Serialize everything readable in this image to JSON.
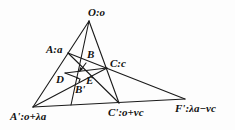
{
  "diagram": {
    "type": "geometric-construction",
    "points": {
      "O": {
        "label": "O:o",
        "x": 89,
        "y": 21
      },
      "A": {
        "label": "A:a",
        "x": 68,
        "y": 53
      },
      "C": {
        "label": "C:c",
        "x": 107,
        "y": 68
      },
      "B": {
        "label": "B",
        "x": 79,
        "y": 72
      },
      "Bp": {
        "label": "B'",
        "x": 77,
        "y": 81
      },
      "D": {
        "label": "D",
        "x": 66,
        "y": 73
      },
      "E": {
        "label": "E",
        "x": 82,
        "y": 76
      },
      "Ap": {
        "label": "A':o+λa",
        "x": 33,
        "y": 107
      },
      "Cp": {
        "label": "C':o+νc",
        "x": 119,
        "y": 103
      },
      "Fp": {
        "label": "F':λa−νc",
        "x": 185,
        "y": 99
      }
    },
    "labels": {
      "O": "O:o",
      "A": "A:a",
      "B": "B",
      "C": "C:c",
      "D": "D",
      "E": "E",
      "Bp": "B'",
      "Ap": "A':o+λa",
      "Cp": "C':o+νc",
      "Fp": "F':λa−νc"
    },
    "line_color": "#1a1a1a"
  }
}
